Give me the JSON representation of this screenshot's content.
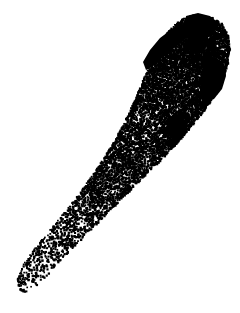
{
  "figure": {
    "caption": "",
    "technique": "stippling",
    "orientation": "anterior upper-right, posterior lower-left",
    "background_color": "#ffffff",
    "ink_color": "#000000",
    "canvas": {
      "width": 240,
      "height": 313
    }
  },
  "chart_data": {
    "type": "scatter",
    "xlabel": "",
    "ylabel": "",
    "xlim": [
      0,
      240
    ],
    "ylim": [
      0,
      313
    ],
    "grid": false,
    "legend": "none",
    "point_color": "#000000",
    "point_size_px": 1.6,
    "total_points_estimate": 8200,
    "body_outline": [
      [
        196,
        14
      ],
      [
        210,
        16
      ],
      [
        221,
        23
      ],
      [
        227,
        34
      ],
      [
        229,
        47
      ],
      [
        227,
        62
      ],
      [
        222,
        78
      ],
      [
        214,
        94
      ],
      [
        203,
        110
      ],
      [
        190,
        126
      ],
      [
        176,
        142
      ],
      [
        161,
        158
      ],
      [
        146,
        173
      ],
      [
        130,
        189
      ],
      [
        114,
        205
      ],
      [
        98,
        221
      ],
      [
        82,
        237
      ],
      [
        67,
        252
      ],
      [
        54,
        266
      ],
      [
        43,
        278
      ],
      [
        33,
        287
      ],
      [
        25,
        291
      ],
      [
        19,
        290
      ],
      [
        16,
        284
      ],
      [
        17,
        274
      ],
      [
        24,
        261
      ],
      [
        36,
        245
      ],
      [
        50,
        228
      ],
      [
        64,
        211
      ],
      [
        78,
        193
      ],
      [
        91,
        175
      ],
      [
        103,
        157
      ],
      [
        114,
        139
      ],
      [
        124,
        120
      ],
      [
        133,
        101
      ],
      [
        141,
        82
      ],
      [
        149,
        63
      ],
      [
        157,
        46
      ],
      [
        166,
        32
      ],
      [
        177,
        21
      ],
      [
        188,
        15
      ],
      [
        196,
        14
      ]
    ],
    "density_zones": [
      {
        "name": "head-dense",
        "cx": 185,
        "cy": 55,
        "rx": 48,
        "ry": 46,
        "relative_density": 1.0
      },
      {
        "name": "mid-body",
        "cx": 130,
        "cy": 135,
        "rx": 52,
        "ry": 52,
        "relative_density": 0.72
      },
      {
        "name": "mid-band",
        "cx": 100,
        "cy": 178,
        "rx": 45,
        "ry": 24,
        "relative_density": 0.82
      },
      {
        "name": "tail-sparse",
        "cx": 55,
        "cy": 250,
        "rx": 42,
        "ry": 46,
        "relative_density": 0.42
      }
    ],
    "dark_patches": [
      {
        "name": "anterior-left-band",
        "points": [
          [
            143,
            62
          ],
          [
            150,
            50
          ],
          [
            160,
            38
          ],
          [
            172,
            29
          ],
          [
            183,
            25
          ],
          [
            190,
            30
          ],
          [
            184,
            40
          ],
          [
            173,
            49
          ],
          [
            162,
            58
          ],
          [
            152,
            67
          ],
          [
            146,
            70
          ]
        ],
        "fill": "#000000"
      },
      {
        "name": "anterior-crest",
        "points": [
          [
            186,
            16
          ],
          [
            198,
            13
          ],
          [
            210,
            16
          ],
          [
            219,
            24
          ],
          [
            214,
            33
          ],
          [
            203,
            37
          ],
          [
            192,
            35
          ],
          [
            185,
            28
          ]
        ],
        "fill": "#000000"
      },
      {
        "name": "right-lateral-crescent",
        "points": [
          [
            206,
            58
          ],
          [
            216,
            57
          ],
          [
            224,
            64
          ],
          [
            226,
            76
          ],
          [
            222,
            89
          ],
          [
            214,
            99
          ],
          [
            205,
            103
          ],
          [
            200,
            96
          ],
          [
            201,
            82
          ],
          [
            203,
            68
          ]
        ],
        "fill": "#000000"
      },
      {
        "name": "mid-dorsal-spot",
        "points": [
          [
            172,
            118
          ],
          [
            181,
            116
          ],
          [
            188,
            123
          ],
          [
            187,
            133
          ],
          [
            180,
            139
          ],
          [
            171,
            138
          ],
          [
            166,
            130
          ],
          [
            167,
            122
          ]
        ],
        "fill": "#000000"
      },
      {
        "name": "upper-margin-shade",
        "points": [
          [
            188,
            36
          ],
          [
            200,
            38
          ],
          [
            207,
            45
          ],
          [
            203,
            53
          ],
          [
            193,
            54
          ],
          [
            186,
            47
          ]
        ],
        "fill": "#000000"
      }
    ],
    "margin_line": {
      "name": "body-margin-stipple",
      "description": "dense stipple concentration tracing the left and lower body margin",
      "relative_density": 1.35
    }
  },
  "labels": {
    "figure_number": "",
    "scale_bar": "",
    "annotations": []
  }
}
